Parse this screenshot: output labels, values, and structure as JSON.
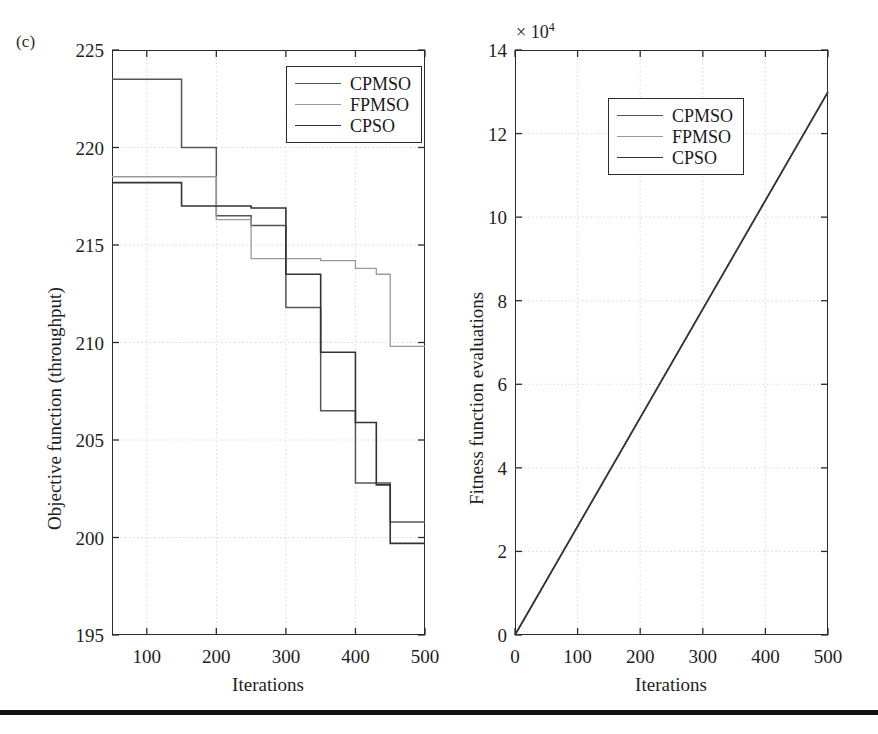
{
  "figure": {
    "panel_label": "(c)",
    "background_color": "#ffffff",
    "rule_color": "#111111"
  },
  "series_styles": [
    {
      "name": "CPMSO",
      "color": "#555555",
      "width": 1.5
    },
    {
      "name": "FPMSO",
      "color": "#9a9a9a",
      "width": 1.3
    },
    {
      "name": "CPSO",
      "color": "#333333",
      "width": 1.6
    }
  ],
  "left_panel": {
    "legend": {
      "entries": [
        "CPMSO",
        "FPMSO",
        "CPSO"
      ]
    },
    "axis_title_x": "Iterations",
    "axis_title_y": "Objective function (throughput)",
    "x_ticks": [
      100,
      200,
      300,
      400,
      500
    ],
    "y_ticks": [
      195,
      200,
      205,
      210,
      215,
      220,
      225
    ]
  },
  "right_panel": {
    "legend": {
      "entries": [
        "CPMSO",
        "FPMSO",
        "CPSO"
      ]
    },
    "axis_title_x": "Iterations",
    "axis_title_y": "Fitness function evaluations",
    "exponent_label": "× 10",
    "exponent_power": "4",
    "x_ticks": [
      0,
      100,
      200,
      300,
      400,
      500
    ],
    "y_ticks": [
      0,
      2,
      4,
      6,
      8,
      10,
      12,
      14
    ]
  },
  "chart_data": [
    {
      "type": "line",
      "id": "left-objective-function",
      "title": "",
      "panel": "(c)",
      "xlabel": "Iterations",
      "ylabel": "Objective function (throughput)",
      "xlim": [
        50,
        500
      ],
      "ylim": [
        195,
        225
      ],
      "xticks": [
        100,
        200,
        300,
        400,
        500
      ],
      "yticks": [
        195,
        200,
        205,
        210,
        215,
        220,
        225
      ],
      "grid": true,
      "legend_position": "upper right",
      "step_style": "post",
      "series": [
        {
          "name": "CPMSO",
          "color": "#555555",
          "x": [
            50,
            150,
            200,
            250,
            300,
            350,
            400,
            450,
            500
          ],
          "y": [
            223.5,
            220.0,
            216.5,
            216.0,
            211.8,
            206.5,
            202.8,
            200.8,
            200.8
          ]
        },
        {
          "name": "FPMSO",
          "color": "#9a9a9a",
          "x": [
            50,
            200,
            250,
            350,
            400,
            430,
            450,
            500
          ],
          "y": [
            218.5,
            216.3,
            214.3,
            214.2,
            213.8,
            213.5,
            209.8,
            209.8
          ]
        },
        {
          "name": "CPSO",
          "color": "#333333",
          "x": [
            50,
            150,
            250,
            300,
            350,
            400,
            430,
            450,
            500
          ],
          "y": [
            218.2,
            217.0,
            216.9,
            213.5,
            209.5,
            205.9,
            202.7,
            199.7,
            199.7
          ]
        }
      ]
    },
    {
      "type": "line",
      "id": "right-fitness-evaluations",
      "title": "",
      "xlabel": "Iterations",
      "ylabel": "Fitness function evaluations",
      "y_exponent": "× 10^4",
      "xlim": [
        0,
        500
      ],
      "ylim": [
        0,
        14
      ],
      "xticks": [
        0,
        100,
        200,
        300,
        400,
        500
      ],
      "yticks": [
        0,
        2,
        4,
        6,
        8,
        10,
        12,
        14
      ],
      "grid": true,
      "legend_position": "upper left",
      "note": "All three series overlap exactly on one straight line.",
      "series": [
        {
          "name": "CPMSO",
          "color": "#555555",
          "x": [
            0,
            500
          ],
          "y": [
            0,
            13.0
          ]
        },
        {
          "name": "FPMSO",
          "color": "#9a9a9a",
          "x": [
            0,
            500
          ],
          "y": [
            0,
            13.0
          ]
        },
        {
          "name": "CPSO",
          "color": "#333333",
          "x": [
            0,
            500
          ],
          "y": [
            0,
            13.0
          ]
        }
      ]
    }
  ]
}
